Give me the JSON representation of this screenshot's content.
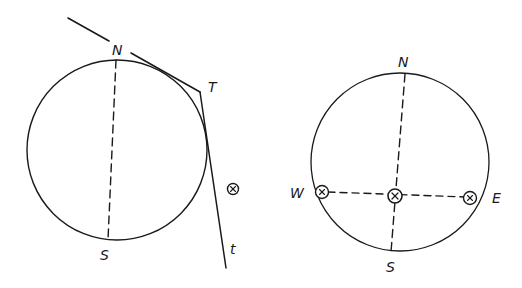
{
  "diagram": {
    "left_figure": {
      "labels": {
        "north": "N",
        "south": "S",
        "tangent_point": "T",
        "tangent_line": "t"
      },
      "symbols": [
        "circled-x"
      ]
    },
    "right_figure": {
      "labels": {
        "north": "N",
        "south": "S",
        "west": "W",
        "east": "E"
      },
      "symbols": [
        "circled-x-west",
        "circled-x-center",
        "circled-x-east"
      ]
    },
    "colors": {
      "ink": "#1a1a1a",
      "background": "#ffffff"
    }
  }
}
